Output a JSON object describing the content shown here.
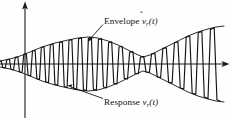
{
  "figure": {
    "name": "envelope-and-response-waveform",
    "background_color": "#fefefe",
    "ink_color": "#131313",
    "width": 232,
    "height": 120
  },
  "labels": {
    "envelope": {
      "prefix": "Envelope",
      "symbol_base": "v",
      "symbol_hat": "ˆ",
      "symbol_subscript": "r",
      "symbol_arg": "(t)",
      "full_text": "Envelope v̂r(t)"
    },
    "response": {
      "prefix": "Response",
      "symbol_base": "v",
      "symbol_subscript": "r",
      "symbol_arg": "(t)",
      "full_text": "Response vr(t)"
    }
  },
  "axes": {
    "vertical": {
      "x": 25,
      "y_top": 2,
      "y_bottom": 118,
      "arrow": "up"
    },
    "horizontal": {
      "y": 64,
      "x_left": 0,
      "x_right": 229,
      "arrow": "right"
    }
  },
  "leaders": {
    "envelope": {
      "from_x": 103,
      "from_y": 25,
      "to_x": 88,
      "to_y": 41,
      "arrow": "down-left"
    },
    "response": {
      "from_x": 103,
      "from_y": 99,
      "to_x": 68,
      "to_y": 85,
      "arrow": "up-left"
    }
  },
  "chart_data": {
    "type": "line",
    "title": "",
    "subtitle": "",
    "xlabel": "t",
    "ylabel": "v_r(t)",
    "grid": false,
    "legend_position": "inline-annotation",
    "axis_center_y": 64,
    "xlim": [
      0,
      232
    ],
    "ylim": [
      120,
      0
    ],
    "series": [
      {
        "name": "Response v_r(t)",
        "kind": "oscillation",
        "cycles": 22,
        "stroke": "#131313"
      },
      {
        "name": "Envelope v̂_r(t) upper",
        "kind": "envelope-upper",
        "stroke": "#1d1d1d"
      },
      {
        "name": "Envelope v̂_r(t) lower",
        "kind": "envelope-lower",
        "stroke": "#1d1d1d"
      }
    ],
    "envelope_control_points": [
      {
        "x": 0,
        "amplitude": 3
      },
      {
        "x": 10,
        "amplitude": 5
      },
      {
        "x": 20,
        "amplitude": 8
      },
      {
        "x": 30,
        "amplitude": 12
      },
      {
        "x": 42,
        "amplitude": 17
      },
      {
        "x": 55,
        "amplitude": 21
      },
      {
        "x": 68,
        "amplitude": 24
      },
      {
        "x": 78,
        "amplitude": 26
      },
      {
        "x": 88,
        "amplitude": 27
      },
      {
        "x": 98,
        "amplitude": 26
      },
      {
        "x": 108,
        "amplitude": 23
      },
      {
        "x": 118,
        "amplitude": 19
      },
      {
        "x": 128,
        "amplitude": 14
      },
      {
        "x": 136,
        "amplitude": 10
      },
      {
        "x": 143,
        "amplitude": 7
      },
      {
        "x": 150,
        "amplitude": 9
      },
      {
        "x": 158,
        "amplitude": 13
      },
      {
        "x": 168,
        "amplitude": 18
      },
      {
        "x": 178,
        "amplitude": 23
      },
      {
        "x": 188,
        "amplitude": 28
      },
      {
        "x": 198,
        "amplitude": 32
      },
      {
        "x": 208,
        "amplitude": 35
      },
      {
        "x": 216,
        "amplitude": 37
      },
      {
        "x": 224,
        "amplitude": 38
      }
    ]
  }
}
